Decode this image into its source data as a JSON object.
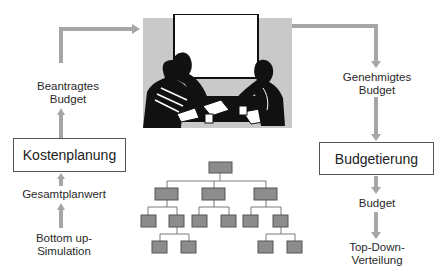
{
  "diagram": {
    "title": "",
    "left_column": {
      "box_label": "Kostenplanung",
      "output_label_line1": "Beantragtes",
      "output_label_line2": "Budget",
      "input_label": "Gesamtplanwert",
      "source_label_line1": "Bottom up-",
      "source_label_line2": "Simulation"
    },
    "right_column": {
      "input_label_line1": "Genehmigtes",
      "input_label_line2": "Budget",
      "box_label": "Budgetierung",
      "output_label": "Budget",
      "target_label_line1": "Top-Down-",
      "target_label_line2": "Verteilung"
    },
    "center": {
      "image": "meeting-illustration",
      "org_chart": {
        "levels": 4,
        "root": 1,
        "level1": 3,
        "level2": 6,
        "level3": 4
      }
    },
    "colors": {
      "arrow": "#a6a6a6",
      "org_box_fill": "#8c8c8c",
      "org_box_border": "#555555",
      "org_line": "#7a7a7a",
      "panel_bg": "#c9c9c9"
    }
  }
}
